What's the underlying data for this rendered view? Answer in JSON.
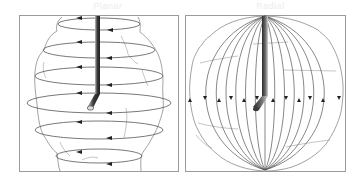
{
  "figure": {
    "panels": [
      {
        "id": "left",
        "title": "Planar",
        "description": "Horizontal circular loops (latitudes) around an irregular borehole-shaped volume with a bent drill string at center",
        "loop_count": 7,
        "frame": {
          "x": 19,
          "y": 15,
          "w": 159,
          "h": 156
        }
      },
      {
        "id": "right",
        "title": "Radial",
        "description": "Meridian lines converging at top and bottom poles inside a roughly spherical outline with a bent drill string at center",
        "meridian_count": 12,
        "frame": {
          "x": 185,
          "y": 15,
          "w": 160,
          "h": 156
        }
      }
    ],
    "colors": {
      "frame": "#9a9a9a",
      "line": "#555555",
      "outline": "#7a7a7a",
      "drill_dark": "#2a2a2a",
      "drill_light": "#bdbdbd",
      "title": "#ececec"
    }
  }
}
